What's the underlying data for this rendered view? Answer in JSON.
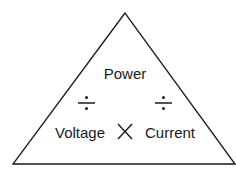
{
  "diagram": {
    "type": "formula-triangle",
    "top": "Power",
    "bottom_left": "Voltage",
    "bottom_right": "Current",
    "operators": {
      "left_divide": "÷",
      "right_divide": "÷",
      "multiply": "×"
    },
    "colors": {
      "stroke": "#1a1a1a",
      "background": "#ffffff"
    }
  }
}
